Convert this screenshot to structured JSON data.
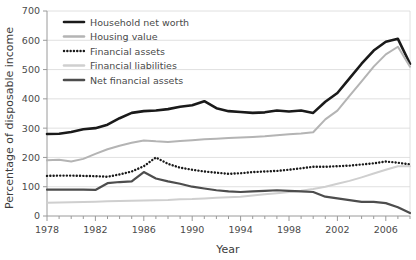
{
  "chart_data": {
    "type": "line",
    "title": "",
    "xlabel": "Year",
    "ylabel": "Percentage of disposable income",
    "xlim": [
      1978,
      2008
    ],
    "ylim": [
      0,
      700
    ],
    "yticks": [
      0,
      100,
      200,
      300,
      400,
      500,
      600,
      700
    ],
    "xticks": [
      1978,
      1982,
      1986,
      1990,
      1994,
      1998,
      2002,
      2006
    ],
    "xtick_labels": [
      "1978",
      "1982",
      "1986",
      "1990",
      "1994",
      "1998",
      "2002",
      "2006"
    ],
    "ytick_labels": [
      "0",
      "100",
      "200",
      "300",
      "400",
      "500",
      "600",
      "700"
    ],
    "grid": "horizontal",
    "legend_position": "top-left",
    "x": [
      1978,
      1979,
      1980,
      1981,
      1982,
      1983,
      1984,
      1985,
      1986,
      1987,
      1988,
      1989,
      1990,
      1991,
      1992,
      1993,
      1994,
      1995,
      1996,
      1997,
      1998,
      1999,
      2000,
      2001,
      2002,
      2003,
      2004,
      2005,
      2006,
      2007,
      2008
    ],
    "series": [
      {
        "name": "Household net worth",
        "color": "#1a1a1a",
        "style": "solid",
        "width": 2.6,
        "values": [
          280,
          281,
          287,
          296,
          300,
          312,
          334,
          352,
          358,
          360,
          365,
          373,
          378,
          392,
          368,
          358,
          355,
          352,
          354,
          360,
          357,
          360,
          352,
          350,
          348,
          340,
          338,
          345,
          352,
          360,
          365
        ]
      },
      {
        "name": "Housing value",
        "color": "#b4b4b4",
        "style": "solid",
        "width": 2.0,
        "values": [
          190,
          192,
          186,
          195,
          212,
          228,
          240,
          250,
          258,
          255,
          253,
          256,
          259,
          262,
          264,
          266,
          268,
          270,
          272,
          276,
          279,
          282,
          286,
          290,
          292,
          294,
          298,
          302,
          306,
          310,
          314
        ]
      },
      {
        "name": "Financial assets",
        "color": "#1a1a1a",
        "style": "dotted",
        "width": 2.2,
        "values": [
          137,
          138,
          138,
          137,
          136,
          134,
          142,
          152,
          170,
          200,
          178,
          165,
          158,
          152,
          148,
          144,
          146,
          150,
          152,
          154,
          158,
          163,
          168,
          172,
          170,
          166,
          160,
          158,
          156,
          155,
          158
        ]
      },
      {
        "name": "Financial liabilities",
        "color": "#cfcfcf",
        "style": "solid",
        "width": 2.0,
        "values": [
          45,
          46,
          47,
          48,
          49,
          50,
          51,
          52,
          53,
          54,
          55,
          57,
          58,
          60,
          62,
          64,
          66,
          70,
          74,
          78,
          82,
          86,
          92,
          98,
          104,
          112,
          122,
          134,
          146,
          158,
          168
        ]
      },
      {
        "name": "Net financial assets",
        "color": "#4d4d4d",
        "style": "solid",
        "width": 2.2,
        "values": [
          90,
          90,
          90,
          90,
          89,
          112,
          116,
          118,
          150,
          128,
          118,
          110,
          100,
          94,
          88,
          84,
          82,
          84,
          86,
          88,
          86,
          84,
          82,
          80,
          72,
          64,
          56,
          50,
          48,
          40,
          26
        ]
      }
    ],
    "series_late": {
      "note": "tail segment 2001-2008 values overriding for net-worth and housing",
      "x": [
        2001,
        2002,
        2003,
        2004,
        2005,
        2006,
        2007,
        2008
      ],
      "household_net_worth": [
        390,
        420,
        470,
        520,
        565,
        595,
        605,
        520
      ],
      "housing_value": [
        330,
        360,
        410,
        460,
        510,
        552,
        578,
        510
      ],
      "financial_assets": [
        168,
        170,
        172,
        176,
        180,
        186,
        182,
        176
      ],
      "financial_liabilities": [
        100,
        110,
        120,
        132,
        145,
        158,
        170,
        170
      ],
      "net_financial_assets": [
        66,
        60,
        54,
        48,
        48,
        44,
        30,
        10
      ]
    }
  },
  "legend": {
    "items": [
      {
        "label": "Household net worth",
        "color": "#1a1a1a",
        "style": "solid"
      },
      {
        "label": "Housing value",
        "color": "#b4b4b4",
        "style": "solid"
      },
      {
        "label": "Financial assets",
        "color": "#1a1a1a",
        "style": "dotted"
      },
      {
        "label": "Financial liabilities",
        "color": "#cfcfcf",
        "style": "solid"
      },
      {
        "label": "Net financial assets",
        "color": "#4d4d4d",
        "style": "solid"
      }
    ]
  }
}
